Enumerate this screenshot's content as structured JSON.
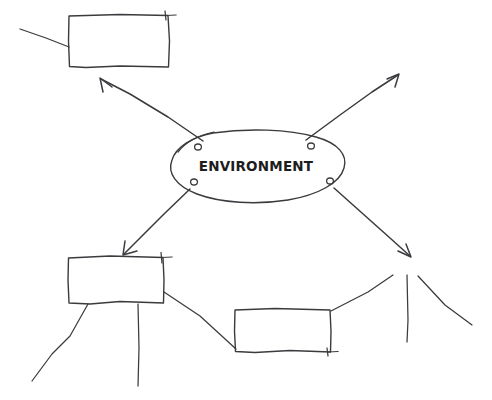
{
  "diagram": {
    "kind": "hand-drawn-mind-map",
    "background_color": "#ffffff",
    "ink_color": "#3b3b3f",
    "text_color": "#1d1d20",
    "canvas": {
      "width": 492,
      "height": 400
    },
    "center_node": {
      "label": "ENVIRONMENT",
      "shape": "ellipse",
      "cx": 256,
      "cy": 166,
      "rx": 89,
      "ry": 35
    },
    "branch_nodes": [
      {
        "name": "top-left-box",
        "label": "",
        "shape": "rectangle",
        "x": 69,
        "y": 15,
        "width": 100,
        "height": 52
      },
      {
        "name": "bottom-left-box",
        "label": "",
        "shape": "rectangle",
        "x": 68,
        "y": 256,
        "width": 96,
        "height": 48
      },
      {
        "name": "bottom-center-box",
        "label": "",
        "shape": "rectangle",
        "x": 235,
        "y": 308,
        "width": 96,
        "height": 45
      }
    ],
    "connectors": [
      {
        "name": "connector-to-top-left-box",
        "from": "center_node",
        "to": "top-left-box",
        "arrow": true,
        "direction": "up-left"
      },
      {
        "name": "connector-to-top-right-open",
        "from": "center_node",
        "to": "open-end-top-right",
        "arrow": true,
        "direction": "up-right"
      },
      {
        "name": "connector-to-bottom-left-box",
        "from": "center_node",
        "to": "bottom-left-box",
        "arrow": true,
        "direction": "down-left"
      },
      {
        "name": "connector-to-bottom-right-open",
        "from": "center_node",
        "to": "open-end-bottom-right",
        "arrow": true,
        "direction": "down-right"
      },
      {
        "name": "stub-top-left-box-left",
        "from": "top-left-box",
        "to": "open-end-left",
        "arrow": false,
        "direction": "left"
      },
      {
        "name": "stub-bottom-left-box-down-a",
        "from": "bottom-left-box",
        "to": "open-end-below-left-a",
        "arrow": false,
        "direction": "down-left"
      },
      {
        "name": "stub-bottom-left-box-down-b",
        "from": "bottom-left-box",
        "to": "open-end-below-left-b",
        "arrow": false,
        "direction": "down"
      },
      {
        "name": "connector-left-box-to-center-box",
        "from": "bottom-left-box",
        "to": "bottom-center-box",
        "arrow": false,
        "direction": "down-right"
      },
      {
        "name": "stub-bottom-center-box-up-right",
        "from": "bottom-center-box",
        "to": "open-end-bottom-right",
        "arrow": false,
        "direction": "up-right"
      },
      {
        "name": "stub-bottom-right-fan-vertical",
        "from": "open-end-bottom-right",
        "to": "open-end-fan-down",
        "arrow": false,
        "direction": "down"
      },
      {
        "name": "stub-bottom-right-fan-diagonal",
        "from": "open-end-bottom-right",
        "to": "open-end-fan-right",
        "arrow": false,
        "direction": "down-right"
      }
    ],
    "loop_marks": [
      {
        "name": "loop-mark-upper-left",
        "cx": 196,
        "cy": 145
      },
      {
        "name": "loop-mark-upper-right",
        "cx": 312,
        "cy": 145
      },
      {
        "name": "loop-mark-lower-left",
        "cx": 192,
        "cy": 184
      },
      {
        "name": "loop-mark-lower-right",
        "cx": 330,
        "cy": 184
      }
    ]
  }
}
